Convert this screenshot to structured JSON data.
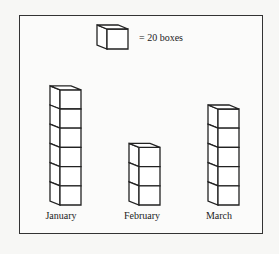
{
  "legend": {
    "text": "= 20 boxes",
    "unit_value": 20,
    "icon": "cube-icon"
  },
  "chart_data": {
    "type": "bar",
    "title": "",
    "xlabel": "",
    "ylabel": "",
    "pictograph": true,
    "unit": "cube = 20 boxes",
    "categories": [
      "January",
      "February",
      "March"
    ],
    "icons_per_category": [
      6,
      3,
      5
    ],
    "values": [
      120,
      60,
      100
    ],
    "grid": false
  },
  "labels": {
    "january": "January",
    "february": "February",
    "march": "March"
  }
}
